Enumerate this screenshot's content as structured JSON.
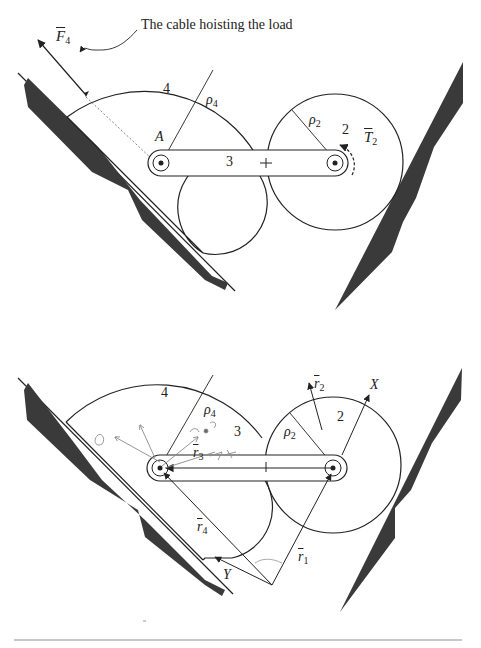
{
  "top_figure": {
    "annotation": "The cable hoisting the load",
    "labels": {
      "force": "F",
      "force_sub": "4",
      "body4": "4",
      "rho4": "ρ",
      "rho4_sub": "4",
      "point_A": "A",
      "body3": "3",
      "rho2": "ρ",
      "rho2_sub": "2",
      "body2": "2",
      "torque": "T",
      "torque_sub": "2"
    }
  },
  "bottom_figure": {
    "labels": {
      "body4": "4",
      "rho4": "ρ",
      "rho4_sub": "4",
      "body3": "3",
      "rho2": "ρ",
      "rho2_sub": "2",
      "body2": "2",
      "r2": "r",
      "r2_sub": "2",
      "axis_X": "X",
      "r3": "r",
      "r3_sub": "3",
      "r4": "r",
      "r4_sub": "4",
      "axis_Y": "Y",
      "r1": "r",
      "r1_sub": "1"
    },
    "handwritten_notes": [
      "α",
      "↑",
      "ω₃",
      "g₄",
      "+"
    ]
  },
  "footer": {
    "caption_partial": "· · · · · · · · · · ·"
  },
  "colors": {
    "ink": "#222222",
    "ground_fill": "#3a3a3a",
    "pencil": "#8a8a8a",
    "rule": "#c8c8c8"
  }
}
